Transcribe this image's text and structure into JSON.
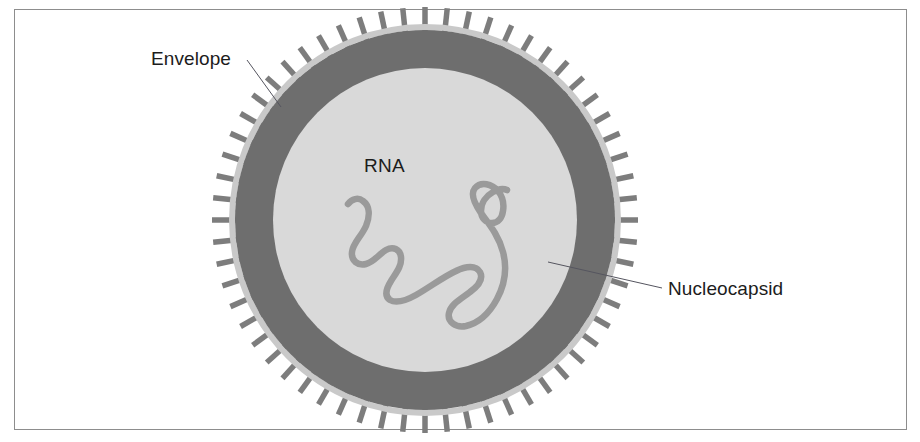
{
  "figure": {
    "type": "biological-diagram",
    "background_color": "#ffffff",
    "frame": {
      "border_color": "#8d8d8d",
      "border_width_px": 1,
      "x": 14,
      "y": 9,
      "width": 893,
      "height": 421
    }
  },
  "labels": {
    "envelope": "Envelope",
    "rna": "RNA",
    "nucleocapsid": "Nucleocapsid"
  },
  "colors": {
    "spike": "#7d7d7d",
    "envelope_line": "#c9c9c9",
    "matrix_ring": "#6e6e6e",
    "nucleocapsid_core": "#d9d9d9",
    "rna_strand": "#9a9a9a",
    "leader_line": "#55555f",
    "text": "#1c1c1c"
  },
  "geometry": {
    "center_x": 425,
    "center_y": 220,
    "core_radius": 152,
    "matrix_outer_radius": 190,
    "envelope_line_radius": 193,
    "spike_outer_radius": 213,
    "spike_count": 60,
    "spike_width": 5.5,
    "matrix_ring_thickness": 38
  },
  "leaders": {
    "envelope": {
      "x1": 247,
      "y1": 60,
      "x2": 281,
      "y2": 107
    },
    "nucleocapsid": {
      "x1": 662,
      "y1": 288,
      "x2": 548,
      "y2": 262
    }
  },
  "rna_path": "M 348 204 C 352 199 358 197 363 201 C 370 206 370 216 366 226 C 361 237 353 243 352 252 C 351 261 358 266 366 264 C 374 262 379 254 386 250 C 393 246 400 249 401 257 C 402 266 396 273 391 281 C 386 289 384 296 390 300 C 397 304 407 300 416 295 C 430 287 443 277 456 271 C 466 266 476 265 480 272 C 484 280 477 287 470 292 C 461 299 451 304 449 313 C 447 322 456 328 466 326 C 479 323 490 312 497 299 C 505 284 507 267 503 252 C 499 236 489 224 481 213 C 474 203 470 194 475 188 C 481 181 492 184 498 191 C 503 197 504 205 503 211 C 502 218 498 223 492 223 C 486 223 481 218 481 211 C 481 203 486 196 493 192 C 498 189 503 188 507 190"
}
